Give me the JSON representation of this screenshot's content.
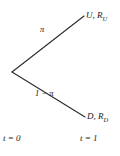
{
  "diagram": {
    "type": "binomial-tree",
    "title": "",
    "background_color": "#ffffff",
    "line_color": "#2b2b2b",
    "text_color": "#1a1a1a",
    "nodes": {
      "root": {
        "label": "",
        "x": 12,
        "y": 72
      },
      "up": {
        "label": "U, R",
        "subscript": "U",
        "x": 84,
        "y": 16
      },
      "down": {
        "label": "D, R",
        "subscript": "D",
        "x": 85,
        "y": 117
      }
    },
    "branches": [
      {
        "name": "up-branch",
        "probability_label": "π",
        "from": [
          12,
          72
        ],
        "to": [
          84,
          16
        ]
      },
      {
        "name": "down-branch",
        "probability_label": "1 − π",
        "from": [
          12,
          72
        ],
        "to": [
          85,
          117
        ]
      }
    ],
    "time_axis": {
      "start_label": "t = 0",
      "end_label": "t = 1"
    }
  }
}
